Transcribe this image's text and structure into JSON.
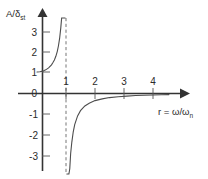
{
  "chart_data": {
    "type": "line",
    "title": "",
    "subtitle": "",
    "xlabel": "r = ω/ωn",
    "ylabel": "A/δst",
    "xlabel_parts": {
      "main": "r = ω/ω",
      "sub": "n"
    },
    "ylabel_parts": {
      "main": "A/δ",
      "sub": "st"
    },
    "xlim": [
      0,
      4.6
    ],
    "ylim": [
      -3.6,
      3.7
    ],
    "xticks": [
      1,
      2,
      3,
      4
    ],
    "xtick_labels": [
      "1",
      "2",
      "3",
      "4"
    ],
    "yticks": [
      -3,
      -2,
      -1,
      0,
      1,
      2,
      3
    ],
    "ytick_labels": [
      "-3",
      "-2",
      "-1",
      "0",
      "1",
      "2",
      "3"
    ],
    "grid": false,
    "legend": null,
    "annotations": [
      {
        "name": "resonance-asymptote",
        "type": "vline",
        "x": 1,
        "style": "dashed",
        "color": "#555555"
      }
    ],
    "series": [
      {
        "name": "magnification-factor-lower-branch",
        "formula": "A/δst = 1/(1 - r^2)",
        "color": "#4d4d4d",
        "x": [
          0.0,
          0.1,
          0.2,
          0.3,
          0.4,
          0.5,
          0.55,
          0.6,
          0.65,
          0.7,
          0.74,
          0.78,
          0.82,
          0.85,
          0.88,
          0.9,
          0.92,
          0.94,
          0.95,
          0.96,
          0.965,
          0.97
        ],
        "values": [
          1.0,
          1.01,
          1.04,
          1.1,
          1.19,
          1.33,
          1.44,
          1.56,
          1.73,
          1.96,
          2.22,
          2.56,
          3.05,
          3.6,
          4.43,
          5.26,
          6.51,
          8.58,
          10.26,
          12.76,
          14.48,
          16.92
        ]
      },
      {
        "name": "magnification-factor-upper-branch",
        "formula": "A/δst = 1/(1 - r^2)",
        "color": "#4d4d4d",
        "x": [
          1.03,
          1.04,
          1.05,
          1.06,
          1.08,
          1.1,
          1.13,
          1.16,
          1.2,
          1.25,
          1.3,
          1.4,
          1.5,
          1.65,
          1.8,
          2.0,
          2.25,
          2.5,
          2.8,
          3.1,
          3.4,
          3.7,
          4.0,
          4.3,
          4.55
        ],
        "values": [
          -16.42,
          -12.25,
          -9.76,
          -8.1,
          -6.01,
          -4.76,
          -3.5,
          -2.8,
          -2.27,
          -1.78,
          -1.45,
          -1.04,
          -0.8,
          -0.58,
          -0.45,
          -0.33,
          -0.25,
          -0.19,
          -0.15,
          -0.12,
          -0.09,
          -0.08,
          -0.07,
          -0.06,
          -0.05
        ]
      }
    ],
    "axis_arrows": {
      "x": true,
      "y": true
    },
    "colors": {
      "axis": "#333333",
      "curve": "#4d4d4d",
      "asymptote": "#666666",
      "text": "#2b2b2b",
      "background": "#ffffff"
    }
  }
}
